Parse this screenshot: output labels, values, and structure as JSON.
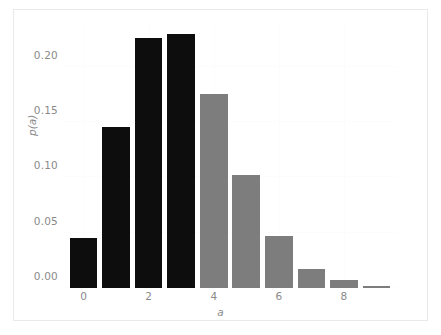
{
  "chart_data": {
    "type": "bar",
    "title": "",
    "subtitle": "",
    "xlabel": "a",
    "ylabel": "p(a)",
    "categories": [
      0,
      1,
      2,
      3,
      4,
      5,
      6,
      7,
      8,
      9
    ],
    "values": [
      0.045,
      0.146,
      0.226,
      0.23,
      0.175,
      0.102,
      0.047,
      0.017,
      0.007,
      0.002
    ],
    "bar_colors": [
      "#0d0d0d",
      "#0d0d0d",
      "#0d0d0d",
      "#0d0d0d",
      "#7d7d7d",
      "#7d7d7d",
      "#7d7d7d",
      "#7d7d7d",
      "#7d7d7d",
      "#7d7d7d"
    ],
    "series": [
      {
        "name": "p(a)",
        "values": [
          0.045,
          0.146,
          0.226,
          0.23,
          0.175,
          0.102,
          0.047,
          0.017,
          0.007,
          0.002
        ]
      }
    ],
    "xlim": [
      -0.6,
      9.6
    ],
    "ylim": [
      0.0,
      0.2405
    ],
    "yticks": [
      0.0,
      0.05,
      0.1,
      0.15,
      0.2
    ],
    "ytick_labels": [
      "0.00",
      "0.05",
      "0.10",
      "0.15",
      "0.20"
    ],
    "xticks": [
      0,
      2,
      4,
      6,
      8
    ],
    "xtick_labels": [
      "0",
      "2",
      "4",
      "6",
      "8"
    ],
    "grid": true,
    "grid_color": "#fcfcfc",
    "legend": null,
    "legend_position": "none",
    "annotations": [],
    "background_color": "#ffffff",
    "frame_color": "#e9e9e9",
    "tick_label_color": "#8a8a8a",
    "highlight_color": "#0d0d0d",
    "secondary_color": "#7d7d7d"
  }
}
